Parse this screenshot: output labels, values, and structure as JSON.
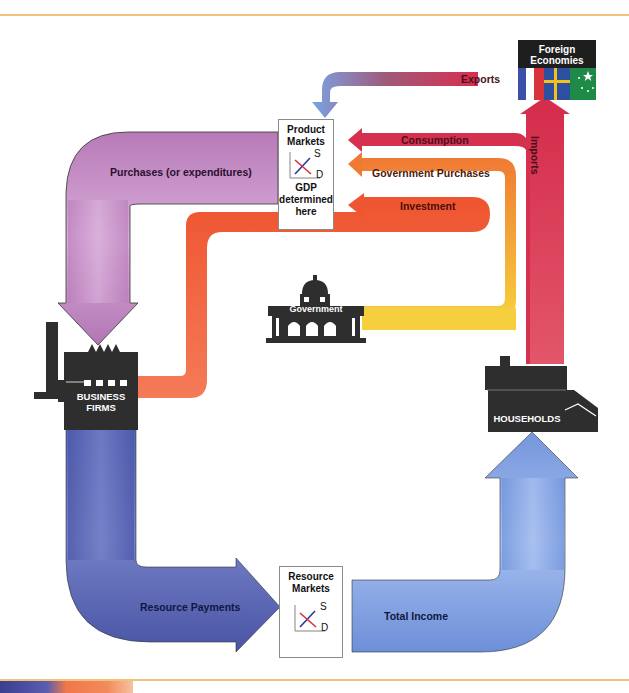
{
  "diagram": {
    "nodes": {
      "foreign": {
        "label_line1": "Foreign",
        "label_line2": "Economies"
      },
      "product_markets": {
        "line1": "Product",
        "line2": "Markets",
        "sub1": "GDP",
        "sub2": "determined",
        "sub3": "here",
        "supply": "S",
        "demand": "D"
      },
      "resource_markets": {
        "line1": "Resource",
        "line2": "Markets",
        "supply": "S",
        "demand": "D"
      },
      "government": {
        "label": "Government"
      },
      "business_firms": {
        "line1": "BUSINESS",
        "line2": "FIRMS"
      },
      "households": {
        "label": "HOUSEHOLDS"
      }
    },
    "flows": {
      "exports": "Exports",
      "imports": "Imports",
      "consumption": "Consumption",
      "government_purchases": "Government Purchases",
      "investment": "Investment",
      "purchases": "Purchases (or expenditures)",
      "resource_payments": "Resource Payments",
      "total_income": "Total Income"
    },
    "colors": {
      "purchases": "#c690c6",
      "consumption": "#d6304f",
      "government_purchases": "#f28a3a",
      "investment": "#ef5a34",
      "government_flow": "#f5cc3a",
      "exports_start": "#d63050",
      "exports_end": "#7aa0e0",
      "resource_payments": "#5563b0",
      "total_income": "#7d9fe0",
      "building": "#2e2e2e",
      "rule": "#f2c27a"
    }
  }
}
